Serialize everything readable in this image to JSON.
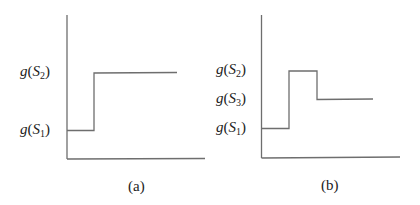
{
  "figure": {
    "panels": [
      {
        "id": "a",
        "caption": "(a)",
        "y_labels": [
          {
            "func": "g",
            "set": "S",
            "sub": "2"
          },
          {
            "func": "g",
            "set": "S",
            "sub": "1"
          }
        ],
        "step_path": [
          [
            0,
            "g(S1)"
          ],
          [
            1,
            "g(S1)"
          ],
          [
            1,
            "g(S2)"
          ],
          [
            4,
            "g(S2)"
          ]
        ]
      },
      {
        "id": "b",
        "caption": "(b)",
        "y_labels": [
          {
            "func": "g",
            "set": "S",
            "sub": "2"
          },
          {
            "func": "g",
            "set": "S",
            "sub": "3"
          },
          {
            "func": "g",
            "set": "S",
            "sub": "1"
          }
        ],
        "step_path": [
          [
            0,
            "g(S1)"
          ],
          [
            1,
            "g(S1)"
          ],
          [
            1,
            "g(S2)"
          ],
          [
            2,
            "g(S2)"
          ],
          [
            2,
            "g(S3)"
          ],
          [
            4,
            "g(S3)"
          ]
        ]
      }
    ],
    "line_color": "#6e6e6e"
  }
}
